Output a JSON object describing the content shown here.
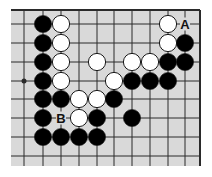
{
  "diagram": {
    "colors": {
      "board": "#d9d9d9",
      "line": "#2a2a2a",
      "black_stone": "#000000",
      "white_stone": "#ffffff",
      "stone_outline": "#1a1a1a",
      "label": "#111111"
    },
    "grid": {
      "cols_x": [
        24,
        43,
        61,
        79,
        97,
        114,
        132,
        150,
        168,
        185
      ],
      "rows_y": [
        24,
        43,
        62,
        81,
        99,
        118,
        137,
        156
      ],
      "board_left": 11,
      "board_top": 10,
      "board_right": 200,
      "board_bottom": 166,
      "top_edge": true,
      "right_edge": true
    },
    "star_points": [
      {
        "col": 0,
        "row": 3
      }
    ],
    "stones": [
      {
        "color": "black",
        "col": 1,
        "row": 0
      },
      {
        "color": "white",
        "col": 2,
        "row": 0
      },
      {
        "color": "white",
        "col": 8,
        "row": 0
      },
      {
        "color": "black",
        "col": 1,
        "row": 1
      },
      {
        "color": "white",
        "col": 2,
        "row": 1
      },
      {
        "color": "white",
        "col": 8,
        "row": 1
      },
      {
        "color": "black",
        "col": 9,
        "row": 1
      },
      {
        "color": "black",
        "col": 1,
        "row": 2
      },
      {
        "color": "white",
        "col": 2,
        "row": 2
      },
      {
        "color": "white",
        "col": 4,
        "row": 2
      },
      {
        "color": "white",
        "col": 6,
        "row": 2
      },
      {
        "color": "white",
        "col": 7,
        "row": 2
      },
      {
        "color": "black",
        "col": 8,
        "row": 2
      },
      {
        "color": "black",
        "col": 9,
        "row": 2
      },
      {
        "color": "black",
        "col": 1,
        "row": 3
      },
      {
        "color": "white",
        "col": 2,
        "row": 3
      },
      {
        "color": "white",
        "col": 5,
        "row": 3
      },
      {
        "color": "black",
        "col": 6,
        "row": 3
      },
      {
        "color": "black",
        "col": 7,
        "row": 3
      },
      {
        "color": "black",
        "col": 8,
        "row": 3
      },
      {
        "color": "black",
        "col": 1,
        "row": 4
      },
      {
        "color": "black",
        "col": 2,
        "row": 4
      },
      {
        "color": "white",
        "col": 3,
        "row": 4
      },
      {
        "color": "white",
        "col": 4,
        "row": 4
      },
      {
        "color": "black",
        "col": 5,
        "row": 4
      },
      {
        "color": "black",
        "col": 1,
        "row": 5
      },
      {
        "color": "white",
        "col": 3,
        "row": 5
      },
      {
        "color": "black",
        "col": 4,
        "row": 5
      },
      {
        "color": "black",
        "col": 6,
        "row": 5
      },
      {
        "color": "black",
        "col": 1,
        "row": 6
      },
      {
        "color": "black",
        "col": 2,
        "row": 6
      },
      {
        "color": "black",
        "col": 3,
        "row": 6
      },
      {
        "color": "black",
        "col": 4,
        "row": 6
      }
    ],
    "labels": [
      {
        "text": "A",
        "col": 9,
        "row": 0
      },
      {
        "text": "B",
        "col": 2,
        "row": 5
      }
    ]
  }
}
